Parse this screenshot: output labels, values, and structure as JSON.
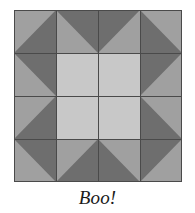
{
  "figure": {
    "name": "sawtooth-star-quilt-block",
    "caption": "Boo!",
    "background_color": "#ffffff"
  },
  "block": {
    "title": "Sawtooth Star quilt block",
    "grid_rows": 4,
    "grid_cols": 4,
    "x": 14,
    "y": 10,
    "width": 168,
    "height": 172,
    "cell_width": 42,
    "cell_height": 43,
    "border_color": "#4a4a4a",
    "seam_line_color": "#4a4a4a"
  },
  "palette": {
    "background_fabric": "#a0a0a0",
    "star_point_fabric": "#6e6e6e",
    "center_fabric": "#c8c8c8",
    "outline": "#4a4a4a"
  },
  "patches": [
    {
      "name": "corner-top-left",
      "row": 1,
      "col": 1,
      "type": "half-square-triangle",
      "base_color": "#a0a0a0",
      "triangle_color": "#6e6e6e",
      "triangle_corner": "bottom-right"
    },
    {
      "name": "star-point-top-left",
      "row": 1,
      "col": 2,
      "type": "flying-geese-half",
      "base_color": "#a0a0a0",
      "triangle_color": "#6e6e6e",
      "triangle_corner": "top-left"
    },
    {
      "name": "star-point-top-right",
      "row": 1,
      "col": 3,
      "type": "flying-geese-half",
      "base_color": "#a0a0a0",
      "triangle_color": "#6e6e6e",
      "triangle_corner": "top-right"
    },
    {
      "name": "corner-top-right",
      "row": 1,
      "col": 4,
      "type": "half-square-triangle",
      "base_color": "#a0a0a0",
      "triangle_color": "#6e6e6e",
      "triangle_corner": "bottom-left"
    },
    {
      "name": "star-point-left-top",
      "row": 2,
      "col": 1,
      "type": "flying-geese-half",
      "base_color": "#a0a0a0",
      "triangle_color": "#6e6e6e",
      "triangle_corner": "top-left"
    },
    {
      "name": "center-top-left",
      "row": 2,
      "col": 2,
      "type": "plain-square",
      "base_color": "#c8c8c8"
    },
    {
      "name": "center-top-right",
      "row": 2,
      "col": 3,
      "type": "plain-square",
      "base_color": "#c8c8c8"
    },
    {
      "name": "star-point-right-top",
      "row": 2,
      "col": 4,
      "type": "flying-geese-half",
      "base_color": "#a0a0a0",
      "triangle_color": "#6e6e6e",
      "triangle_corner": "top-right"
    },
    {
      "name": "star-point-left-bottom",
      "row": 3,
      "col": 1,
      "type": "flying-geese-half",
      "base_color": "#a0a0a0",
      "triangle_color": "#6e6e6e",
      "triangle_corner": "bottom-left"
    },
    {
      "name": "center-bottom-left",
      "row": 3,
      "col": 2,
      "type": "plain-square",
      "base_color": "#c8c8c8"
    },
    {
      "name": "center-bottom-right",
      "row": 3,
      "col": 3,
      "type": "plain-square",
      "base_color": "#c8c8c8"
    },
    {
      "name": "star-point-right-bottom",
      "row": 3,
      "col": 4,
      "type": "flying-geese-half",
      "base_color": "#a0a0a0",
      "triangle_color": "#6e6e6e",
      "triangle_corner": "bottom-right"
    },
    {
      "name": "corner-bottom-left",
      "row": 4,
      "col": 1,
      "type": "half-square-triangle",
      "base_color": "#a0a0a0",
      "triangle_color": "#6e6e6e",
      "triangle_corner": "top-right"
    },
    {
      "name": "star-point-bottom-left",
      "row": 4,
      "col": 2,
      "type": "flying-geese-half",
      "base_color": "#a0a0a0",
      "triangle_color": "#6e6e6e",
      "triangle_corner": "bottom-left"
    },
    {
      "name": "star-point-bottom-right",
      "row": 4,
      "col": 3,
      "type": "flying-geese-half",
      "base_color": "#a0a0a0",
      "triangle_color": "#6e6e6e",
      "triangle_corner": "bottom-right"
    },
    {
      "name": "corner-bottom-right",
      "row": 4,
      "col": 4,
      "type": "half-square-triangle",
      "base_color": "#a0a0a0",
      "triangle_color": "#6e6e6e",
      "triangle_corner": "top-left"
    }
  ]
}
